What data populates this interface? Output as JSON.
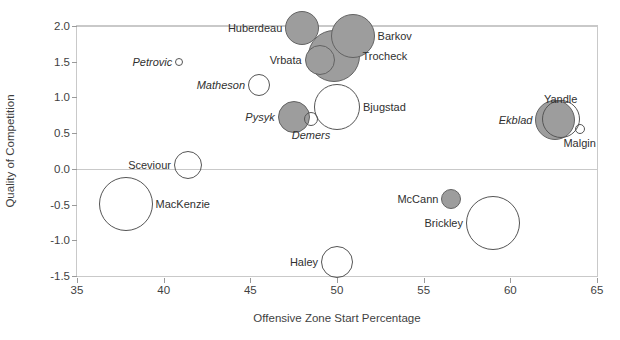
{
  "chart_data": {
    "type": "scatter",
    "title": "",
    "xlabel": "Offensive Zone Start Percentage",
    "ylabel": "Quality of Competition",
    "xlim": [
      35,
      65
    ],
    "ylim": [
      -1.5,
      2.0
    ],
    "xticks": [
      "35",
      "40",
      "45",
      "50",
      "55",
      "60",
      "65"
    ],
    "yticks": [
      "2.0",
      "1.5",
      "1.0",
      "0.5",
      "0.0",
      "-0.5",
      "-1.0",
      "-1.5"
    ],
    "grid": "horizontal-at-zero-and-two",
    "legend": "none",
    "marker_encoding": "bubble size = ice time / usage; gray fill vs open outline = two groups",
    "colors": {
      "filled": "#9d9d9d",
      "filled_stroke": "#636363",
      "open_stroke": "#555555",
      "axis": "#c9c9c9",
      "text": "#303030"
    },
    "points": [
      {
        "name": "Huberdeau",
        "x": 48.0,
        "y": 1.97,
        "size": 17,
        "fill": "filled",
        "label_side": "r",
        "label_italic": false
      },
      {
        "name": "Barkov",
        "x": 50.9,
        "y": 1.86,
        "size": 22,
        "fill": "filled",
        "label_side": "l",
        "label_italic": false
      },
      {
        "name": "Trocheck",
        "x": 49.8,
        "y": 1.58,
        "size": 26,
        "fill": "filled",
        "label_side": "l",
        "label_italic": false
      },
      {
        "name": "Vrbata",
        "x": 49.0,
        "y": 1.53,
        "size": 15,
        "fill": "filled",
        "label_side": "r",
        "label_italic": false
      },
      {
        "name": "Petrovic",
        "x": 40.9,
        "y": 1.5,
        "size": 4,
        "fill": "open",
        "label_side": "r",
        "label_italic": true
      },
      {
        "name": "Matheson",
        "x": 45.5,
        "y": 1.17,
        "size": 11,
        "fill": "open",
        "label_side": "r",
        "label_italic": true
      },
      {
        "name": "Bjugstad",
        "x": 50.0,
        "y": 0.86,
        "size": 23,
        "fill": "open",
        "label_side": "l",
        "label_italic": false
      },
      {
        "name": "Pysyk",
        "x": 47.5,
        "y": 0.73,
        "size": 16,
        "fill": "filled",
        "label_side": "r",
        "label_italic": true
      },
      {
        "name": "Yandle",
        "x": 62.9,
        "y": 0.7,
        "size": 19,
        "fill": "open",
        "label_side": "c",
        "label_italic": false
      },
      {
        "name": "Ekblad",
        "x": 62.6,
        "y": 0.68,
        "size": 20,
        "fill": "filled",
        "label_side": "r",
        "label_italic": true
      },
      {
        "name": "Demers",
        "x": 48.5,
        "y": 0.7,
        "size": 7,
        "fill": "open",
        "label_side": "c",
        "label_italic": true
      },
      {
        "name": "Malgin",
        "x": 64.0,
        "y": 0.56,
        "size": 5,
        "fill": "open",
        "label_side": "c",
        "label_italic": false
      },
      {
        "name": "Sceviour",
        "x": 41.4,
        "y": 0.06,
        "size": 14,
        "fill": "open",
        "label_side": "r",
        "label_italic": false
      },
      {
        "name": "MacKenzie",
        "x": 37.8,
        "y": -0.49,
        "size": 27,
        "fill": "open",
        "label_side": "l",
        "label_italic": false
      },
      {
        "name": "McCann",
        "x": 56.6,
        "y": -0.42,
        "size": 10,
        "fill": "filled",
        "label_side": "r",
        "label_italic": false
      },
      {
        "name": "Brickley",
        "x": 59.0,
        "y": -0.76,
        "size": 27,
        "fill": "open",
        "label_side": "r",
        "label_italic": false
      },
      {
        "name": "Haley",
        "x": 50.0,
        "y": -1.3,
        "size": 16,
        "fill": "open",
        "label_side": "r",
        "label_italic": false
      }
    ]
  }
}
